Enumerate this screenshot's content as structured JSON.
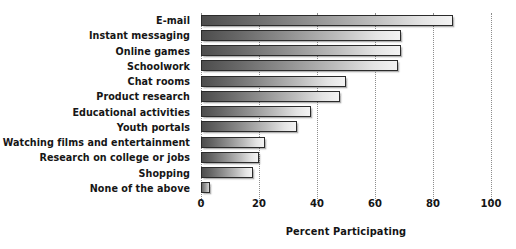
{
  "chart_data": {
    "type": "bar",
    "orientation": "horizontal",
    "title": "",
    "xlabel": "Percent Participating",
    "ylabel": "",
    "xlim": [
      0,
      100
    ],
    "xticks": [
      0,
      20,
      40,
      60,
      80,
      100
    ],
    "grid": "vertical dotted gridlines at each x tick",
    "legend": "none",
    "categories": [
      "E-mail",
      "Instant messaging",
      "Online games",
      "Schoolwork",
      "Chat rooms",
      "Product research",
      "Educational activities",
      "Youth portals",
      "Watching films and entertainment",
      "Research on college or jobs",
      "Shopping",
      "None of the above"
    ],
    "values": [
      87,
      69,
      69,
      68,
      50,
      48,
      38,
      33,
      22,
      20,
      18,
      3
    ]
  },
  "axis": {
    "tick_labels": [
      "0",
      "20",
      "40",
      "60",
      "80",
      "100"
    ],
    "title": "Percent Participating"
  },
  "colors": {
    "bar_gradient_start": "#4d4d4d",
    "bar_gradient_end": "#f3f3f3",
    "bar_border": "#2b2b2b",
    "gridline": "#8d8d8d",
    "text": "#141414",
    "background": "#ffffff"
  }
}
